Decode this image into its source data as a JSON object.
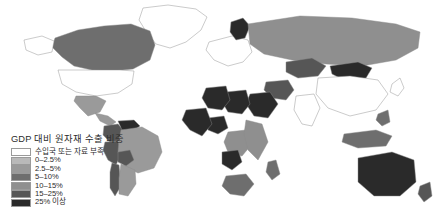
{
  "chart_data": {
    "type": "heatmap",
    "title": "GDP 대비 원자재 수출 비중",
    "subtitle": "",
    "xlabel": "",
    "ylabel": "",
    "legend_position": "bottom-left",
    "grid": false,
    "projection": "world-choropleth",
    "legend_entries": [
      {
        "label": "수입국 또는 자료 부족",
        "color": "#ffffff",
        "min": null,
        "max": null
      },
      {
        "label": "0–2.5%",
        "color": "#b9b9b9",
        "min": 0,
        "max": 2.5
      },
      {
        "label": "2.5–5%",
        "color": "#9a9a9a",
        "min": 2.5,
        "max": 5
      },
      {
        "label": "5–10%",
        "color": "#6e6e6e",
        "min": 5,
        "max": 10
      },
      {
        "label": "10–15%",
        "color": "#8f8f8f",
        "min": 10,
        "max": 15
      },
      {
        "label": "15–25%",
        "color": "#565656",
        "min": 15,
        "max": 25
      },
      {
        "label": "25% 이상",
        "color": "#2a2a2a",
        "min": 25,
        "max": null
      }
    ],
    "categories": [
      "Canada",
      "United States",
      "Mexico",
      "Greenland",
      "Brazil",
      "Venezuela",
      "Colombia",
      "Peru",
      "Chile",
      "Argentina",
      "Bolivia",
      "Russia",
      "Norway",
      "Mongolia",
      "China",
      "India",
      "Saudi Arabia",
      "Iran",
      "Libya",
      "Algeria",
      "Nigeria",
      "Angola",
      "Democratic Republic of the Congo",
      "South Africa",
      "Australia",
      "New Zealand",
      "Indonesia",
      "Kazakhstan",
      "Western Europe"
    ],
    "values": [
      {
        "name": "Canada",
        "bin": "5–10%",
        "color": "#6e6e6e"
      },
      {
        "name": "United States",
        "bin": "수입국 또는 자료 부족",
        "color": "#ffffff"
      },
      {
        "name": "Mexico",
        "bin": "2.5–5%",
        "color": "#9a9a9a"
      },
      {
        "name": "Greenland",
        "bin": "수입국 또는 자료 부족",
        "color": "#ffffff"
      },
      {
        "name": "Brazil",
        "bin": "2.5–5%",
        "color": "#9a9a9a"
      },
      {
        "name": "Venezuela",
        "bin": "25% 이상",
        "color": "#2a2a2a"
      },
      {
        "name": "Colombia",
        "bin": "15–25%",
        "color": "#565656"
      },
      {
        "name": "Peru",
        "bin": "15–25%",
        "color": "#565656"
      },
      {
        "name": "Chile",
        "bin": "15–25%",
        "color": "#565656"
      },
      {
        "name": "Argentina",
        "bin": "2.5–5%",
        "color": "#9a9a9a"
      },
      {
        "name": "Bolivia",
        "bin": "15–25%",
        "color": "#565656"
      },
      {
        "name": "Russia",
        "bin": "10–15%",
        "color": "#8f8f8f"
      },
      {
        "name": "Norway",
        "bin": "25% 이상",
        "color": "#2a2a2a"
      },
      {
        "name": "Mongolia",
        "bin": "25% 이상",
        "color": "#2a2a2a"
      },
      {
        "name": "China",
        "bin": "수입국 또는 자료 부족",
        "color": "#ffffff"
      },
      {
        "name": "India",
        "bin": "수입국 또는 자료 부족",
        "color": "#ffffff"
      },
      {
        "name": "Saudi Arabia",
        "bin": "25% 이상",
        "color": "#2a2a2a"
      },
      {
        "name": "Iran",
        "bin": "15–25%",
        "color": "#565656"
      },
      {
        "name": "Libya",
        "bin": "25% 이상",
        "color": "#2a2a2a"
      },
      {
        "name": "Algeria",
        "bin": "25% 이상",
        "color": "#2a2a2a"
      },
      {
        "name": "Nigeria",
        "bin": "25% 이상",
        "color": "#2a2a2a"
      },
      {
        "name": "Angola",
        "bin": "25% 이상",
        "color": "#2a2a2a"
      },
      {
        "name": "Democratic Republic of the Congo",
        "bin": "10–15%",
        "color": "#8f8f8f"
      },
      {
        "name": "South Africa",
        "bin": "5–10%",
        "color": "#6e6e6e"
      },
      {
        "name": "Australia",
        "bin": "25% 이상",
        "color": "#2a2a2a"
      },
      {
        "name": "New Zealand",
        "bin": "15–25%",
        "color": "#565656"
      },
      {
        "name": "Indonesia",
        "bin": "5–10%",
        "color": "#6e6e6e"
      },
      {
        "name": "Kazakhstan",
        "bin": "15–25%",
        "color": "#565656"
      },
      {
        "name": "Western Europe",
        "bin": "수입국 또는 자료 부족",
        "color": "#ffffff"
      }
    ]
  },
  "legend": {
    "title": "GDP 대비 원자재 수출 비중",
    "rows": [
      {
        "label": "수입국 또는 자료 부족",
        "color": "#ffffff"
      },
      {
        "label": "0–2.5%",
        "color": "#b9b9b9"
      },
      {
        "label": "2.5–5%",
        "color": "#9a9a9a"
      },
      {
        "label": "5–10%",
        "color": "#6e6e6e"
      },
      {
        "label": "10–15%",
        "color": "#8f8f8f"
      },
      {
        "label": "15–25%",
        "color": "#565656"
      },
      {
        "label": "25% 이상",
        "color": "#2a2a2a"
      }
    ]
  },
  "colors": {
    "background": "#ffffff",
    "border": "#8a8a8a",
    "text": "#2b2b2b"
  }
}
